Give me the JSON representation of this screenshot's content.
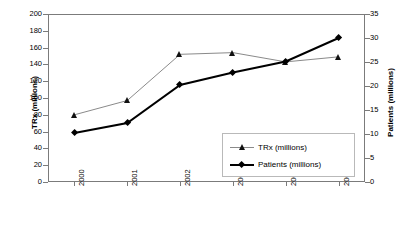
{
  "chart_data": {
    "type": "line",
    "title": "",
    "xlabel": "",
    "categories": [
      "2000",
      "2001",
      "2002",
      "2003",
      "2004",
      "2005"
    ],
    "grid": false,
    "legend_position": "inside-bottom-right",
    "axes": {
      "left": {
        "label": "TRx (millions)",
        "ylim": [
          0,
          200
        ],
        "ticks": [
          0,
          20,
          40,
          60,
          80,
          100,
          120,
          140,
          160,
          180,
          200
        ]
      },
      "right": {
        "label": "Patients (millions)",
        "ylim": [
          0,
          35
        ],
        "ticks": [
          0,
          5,
          10,
          15,
          20,
          25,
          30,
          35
        ]
      }
    },
    "series": [
      {
        "name": "TRx (millions)",
        "axis": "left",
        "marker": "triangle",
        "color": "#8a8a8a",
        "values": [
          80,
          97,
          152,
          154,
          143,
          149
        ]
      },
      {
        "name": "Patients (millions)",
        "axis": "right",
        "marker": "diamond",
        "color": "#000000",
        "values": [
          10.2,
          12.3,
          20.2,
          22.8,
          25.1,
          30.0
        ]
      }
    ]
  },
  "legend": {
    "items": [
      {
        "label": "TRx (millions)"
      },
      {
        "label": "Patients (millions)"
      }
    ]
  }
}
